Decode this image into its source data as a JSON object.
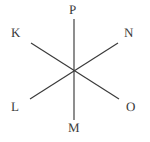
{
  "figure": {
    "type": "line-diagram",
    "canvas": {
      "width": 150,
      "height": 142,
      "background": "#ffffff"
    },
    "stroke": {
      "color": "#3a3a3a",
      "width": 1.15
    },
    "center": {
      "x": 74,
      "y": 71
    },
    "labels": [
      {
        "id": "P",
        "text": "P",
        "position": "top-center",
        "x": 74,
        "y": 10
      },
      {
        "id": "K",
        "text": "K",
        "position": "upper-left",
        "x": 16,
        "y": 33
      },
      {
        "id": "N",
        "text": "N",
        "position": "upper-right",
        "x": 129,
        "y": 33
      },
      {
        "id": "L",
        "text": "L",
        "position": "lower-left",
        "x": 16,
        "y": 107
      },
      {
        "id": "O",
        "text": "O",
        "position": "lower-right",
        "x": 131,
        "y": 107
      },
      {
        "id": "M",
        "text": "M",
        "position": "bottom-center",
        "x": 74,
        "y": 128
      }
    ],
    "lines": [
      {
        "id": "PM",
        "from": "P",
        "to": "M",
        "x1": 74,
        "y1": 19,
        "x2": 74,
        "y2": 120
      },
      {
        "id": "KO",
        "from": "K",
        "to": "O",
        "x1": 31,
        "y1": 43,
        "x2": 119,
        "y2": 99
      },
      {
        "id": "NL",
        "from": "N",
        "to": "L",
        "x1": 118,
        "y1": 43,
        "x2": 30,
        "y2": 99
      }
    ]
  }
}
